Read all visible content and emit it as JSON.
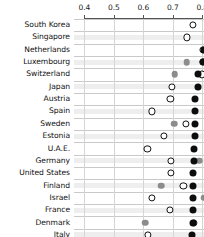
{
  "chart_data": {
    "type": "scatter",
    "title": "",
    "xlabel": "",
    "ylabel": "",
    "xlim": [
      0.365,
      0.806
    ],
    "xticks": [
      0.4,
      0.5,
      0.6,
      0.7,
      0.8
    ],
    "xtick_labels": [
      "0.4",
      "0.5",
      "0.6",
      "0.7",
      "0.8"
    ],
    "grid": true,
    "legend": "none",
    "orientation": "horizontal-dot-plot",
    "axis_position": "top",
    "categories": [
      "South Korea",
      "Singapore",
      "Netherlands",
      "Luxembourg",
      "Switzerland",
      "Japan",
      "Austria",
      "Spain",
      "Sweden",
      "Estonia",
      "U.A.E.",
      "Germany",
      "United States",
      "Finland",
      "Israel",
      "France",
      "Denmark",
      "Italy"
    ],
    "series": [
      {
        "name": "open-marker",
        "marker": "open-circle",
        "color": "#ffffff",
        "edge_color": "#111111",
        "values": [
          0.768,
          0.748,
          0.803,
          0.802,
          0.8,
          0.698,
          0.692,
          0.629,
          0.744,
          0.67,
          0.614,
          0.695,
          0.694,
          0.736,
          0.628,
          0.69,
          0.771,
          0.617
        ]
      },
      {
        "name": "gray-marker",
        "marker": "filled-circle",
        "color": "#8c8c8c",
        "values": [
          null,
          null,
          null,
          0.747,
          0.707,
          null,
          null,
          null,
          0.705,
          null,
          null,
          0.79,
          null,
          0.66,
          0.806,
          null,
          0.607,
          null
        ]
      },
      {
        "name": "black-marker",
        "marker": "filled-circle",
        "color": "#0d0d0d",
        "values": [
          null,
          null,
          0.805,
          0.803,
          0.784,
          0.784,
          0.777,
          0.777,
          0.776,
          0.774,
          0.772,
          0.771,
          0.77,
          0.768,
          0.767,
          0.767,
          0.767,
          0.766
        ]
      }
    ]
  }
}
